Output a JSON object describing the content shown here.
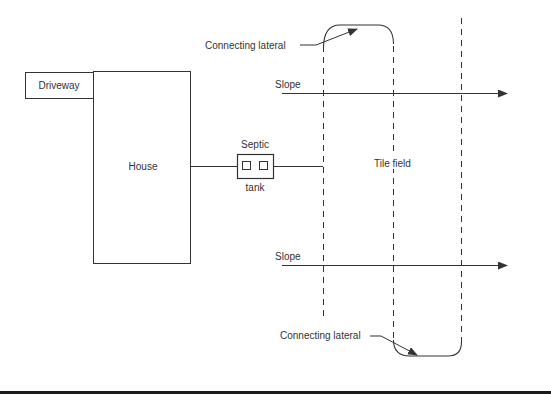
{
  "diagram": {
    "type": "septic-system-layout",
    "labels": {
      "driveway": "Driveway",
      "house": "House",
      "septic_top": "Septic",
      "septic_bottom": "tank",
      "tile_field": "Tile field",
      "slope_top": "Slope",
      "slope_bottom": "Slope",
      "connecting_lateral_top": "Connecting lateral",
      "connecting_lateral_bottom": "Connecting lateral"
    },
    "colors": {
      "stroke": "#333333",
      "background": "#ffffff",
      "bottom_rule": "#1a1a1a"
    }
  }
}
